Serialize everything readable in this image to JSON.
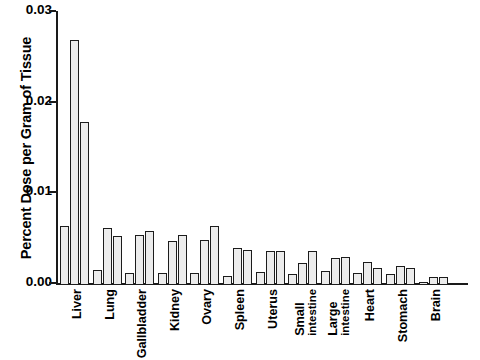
{
  "chart_data": {
    "type": "bar",
    "title": "",
    "subtitle": "",
    "xlabel": "",
    "ylabel": "Percent Dose per Gram of Tissue",
    "ylim": [
      0.0,
      0.03
    ],
    "yticks": [
      "0.00",
      "0.01",
      "0.02",
      "0.03"
    ],
    "ytick_values": [
      0.0,
      0.01,
      0.02,
      0.03
    ],
    "grid": false,
    "legend": "none",
    "categories": [
      "Liver",
      "Lung",
      "Gallbladder",
      "Kidney",
      "Ovary",
      "Spleen",
      "Uterus",
      "Small intestine",
      "Large intestine",
      "Heart",
      "Stomach",
      "Brain"
    ],
    "category_lines": [
      [
        "Liver"
      ],
      [
        "Lung"
      ],
      [
        "Gallbladder"
      ],
      [
        "Kidney"
      ],
      [
        "Ovary"
      ],
      [
        "Spleen"
      ],
      [
        "Uterus"
      ],
      [
        "Small",
        "intestine"
      ],
      [
        "Large",
        "intestine"
      ],
      [
        "Heart"
      ],
      [
        "Stomach"
      ],
      [
        "Brain"
      ]
    ],
    "series": [
      {
        "name": "series-1",
        "values": [
          0.0065,
          0.0017,
          0.0013,
          0.0013,
          0.0013,
          0.001,
          0.0014,
          0.0012,
          0.0015,
          0.0013,
          0.0012,
          0.0003
        ]
      },
      {
        "name": "series-2",
        "values": [
          0.027,
          0.0063,
          0.0055,
          0.0048,
          0.005,
          0.0041,
          0.0038,
          0.0024,
          0.003,
          0.0025,
          0.0021,
          0.0009
        ]
      },
      {
        "name": "series-3",
        "values": [
          0.018,
          0.0054,
          0.006,
          0.0055,
          0.0065,
          0.0039,
          0.0037,
          0.0038,
          0.0031,
          0.0019,
          0.0019,
          0.0009
        ]
      }
    ],
    "bar_style": {
      "fill": "#ececec",
      "edge": "#1c1c1c"
    }
  }
}
